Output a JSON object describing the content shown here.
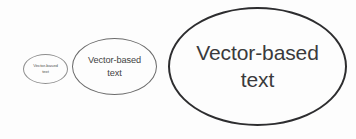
{
  "canvas": {
    "width": 356,
    "height": 139,
    "background_color": "#fdfdfd"
  },
  "figure": {
    "shapes": [
      {
        "name": "small-ellipse",
        "label": "Vector-based\ntext",
        "size_label": "small",
        "stroke_color": "#8e8e8e",
        "text_color": "#555555"
      },
      {
        "name": "medium-ellipse",
        "label": "Vector-based\ntext",
        "size_label": "medium",
        "stroke_color": "#6b6b6b",
        "text_color": "#434343"
      },
      {
        "name": "large-ellipse",
        "label": "Vector-based\ntext",
        "size_label": "large",
        "stroke_color": "#2d2d2f",
        "text_color": "#3a3a3c"
      }
    ]
  }
}
